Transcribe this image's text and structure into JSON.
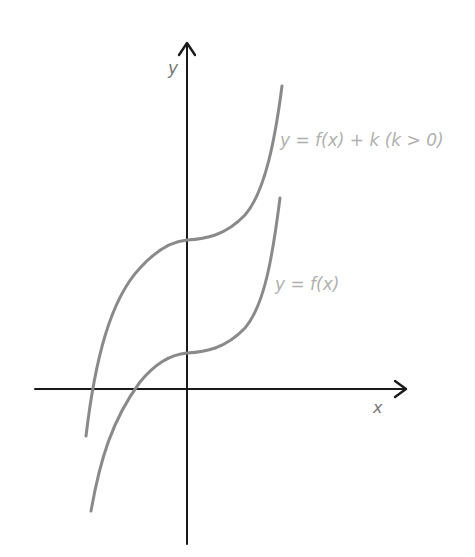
{
  "diagram": {
    "axes": {
      "x_label": "x",
      "y_label": "y"
    },
    "curves": [
      {
        "id": "shifted",
        "label": "y = f(x) + k (k > 0)",
        "color": "#8a8a8a"
      },
      {
        "id": "original",
        "label": "y = f(x)",
        "color": "#8a8a8a"
      }
    ],
    "colors": {
      "axis": "#1a1a1a",
      "curve": "#8a8a8a",
      "label": "#b0b0b0"
    }
  }
}
